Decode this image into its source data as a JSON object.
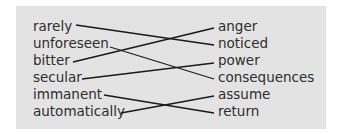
{
  "diagram": {
    "type": "matching-exercise",
    "left_words": [
      "rarely",
      "unforeseen",
      "bitter",
      "secular",
      "immanent",
      "automatically"
    ],
    "right_words": [
      "anger",
      "noticed",
      "power",
      "consequences",
      "assume",
      "return"
    ],
    "connections": [
      {
        "from": "rarely",
        "to": "noticed"
      },
      {
        "from": "unforeseen",
        "to": "consequences"
      },
      {
        "from": "bitter",
        "to": "anger"
      },
      {
        "from": "secular",
        "to": "power"
      },
      {
        "from": "immanent",
        "to": "return"
      },
      {
        "from": "automatically",
        "to": "assume"
      }
    ],
    "colors": {
      "panel": "#e3e3e3",
      "text": "#2e2e2e",
      "line": "#1a1a1a"
    }
  }
}
